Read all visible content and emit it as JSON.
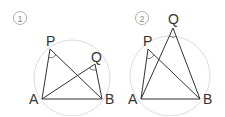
{
  "diagram": {
    "colors": {
      "line": "#333333",
      "circle": "#dddddd",
      "label": "#333333",
      "number": "#888888"
    },
    "panels": [
      {
        "number": "1",
        "labels": {
          "P": "P",
          "Q": "Q",
          "A": "A",
          "B": "B"
        }
      },
      {
        "number": "2",
        "labels": {
          "P": "P",
          "Q": "Q",
          "A": "A",
          "B": "B"
        }
      }
    ]
  }
}
